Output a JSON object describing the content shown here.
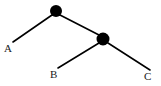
{
  "figure": {
    "kind": "tree-diagram",
    "background_color": "#ffffff",
    "stroke_color": "#000000",
    "label_color": "#1a1a1a",
    "width": 161,
    "height": 86
  },
  "nodes": [
    {
      "id": "root",
      "name": "root-node",
      "shape": "filled-circle",
      "cx": 56,
      "cy": 11,
      "r": 6,
      "color": "#000000"
    },
    {
      "id": "internal",
      "name": "internal-node",
      "shape": "filled-circle",
      "cx": 103,
      "cy": 39,
      "r": 6.5,
      "color": "#000000"
    }
  ],
  "edges": [
    {
      "id": "edge-root-A",
      "name": "edge-root-to-a",
      "x1": 52,
      "y1": 15,
      "x2": 13,
      "y2": 42
    },
    {
      "id": "edge-root-internal",
      "name": "edge-root-to-internal",
      "x1": 60,
      "y1": 15,
      "x2": 99,
      "y2": 35
    },
    {
      "id": "edge-internal-B",
      "name": "edge-internal-to-b",
      "x1": 99,
      "y1": 43,
      "x2": 58,
      "y2": 68
    },
    {
      "id": "edge-internal-C",
      "name": "edge-internal-to-c",
      "x1": 108,
      "y1": 43,
      "x2": 150,
      "y2": 70
    }
  ],
  "labels": {
    "a": "A",
    "b": "B",
    "c": "C"
  }
}
